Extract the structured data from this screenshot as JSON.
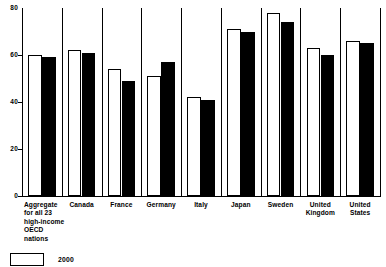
{
  "chart_data": {
    "type": "bar",
    "title": "",
    "subtitle": "",
    "xlabel": "",
    "ylabel": "",
    "ylim": [
      0,
      80
    ],
    "yticks": [
      0,
      20,
      40,
      60,
      80
    ],
    "ytick_labels": [
      "0",
      "20",
      "40",
      "60",
      "80"
    ],
    "grid": false,
    "legend_position": "bottom-left",
    "categories": [
      "Aggregate for all 23 high-income OECD nations",
      "Canada",
      "France",
      "Germany",
      "Italy",
      "Japan",
      "Sweden",
      "United Kingdom",
      "United States"
    ],
    "category_label_lines": [
      [
        "Aggregate",
        "for all 23",
        "high-income",
        "OECD",
        "nations"
      ],
      [
        "Canada"
      ],
      [
        "France"
      ],
      [
        "Germany"
      ],
      [
        "Italy"
      ],
      [
        "Japan"
      ],
      [
        "Sweden"
      ],
      [
        "United",
        "Kingdom"
      ],
      [
        "United",
        "States"
      ]
    ],
    "series": [
      {
        "name": "2000",
        "style": "light",
        "color": "#ffffff",
        "edge_color": "#000000",
        "values": [
          60,
          62,
          54,
          51,
          42,
          71,
          78,
          63,
          66
        ]
      },
      {
        "name": "",
        "style": "dark",
        "color": "#000000",
        "edge_color": "#000000",
        "values": [
          59,
          61,
          49,
          57,
          41,
          70,
          74,
          60,
          65
        ]
      }
    ]
  },
  "legend": {
    "entries": [
      {
        "label": "2000",
        "style": "light"
      }
    ]
  }
}
